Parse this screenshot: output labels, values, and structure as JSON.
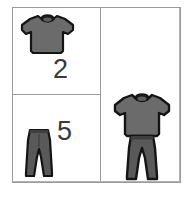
{
  "diagram": {
    "panels": {
      "shirts": {
        "label": "2",
        "item_name": "t-shirt",
        "item_icon": "tshirt-icon"
      },
      "pants": {
        "label": "5",
        "item_name": "pants",
        "item_icon": "pants-icon"
      },
      "outfit": {
        "top_icon": "tshirt-icon",
        "bottom_icon": "pants-icon",
        "item_name": "outfit"
      }
    },
    "colors": {
      "garment_fill": "#6b6b6b",
      "garment_fill_dark": "#595959",
      "garment_outline": "#111111",
      "collar_fill": "#1a1a1a",
      "frame_border": "#9a9a9a",
      "label_text": "#3a3a3a",
      "background": "#ffffff"
    }
  }
}
